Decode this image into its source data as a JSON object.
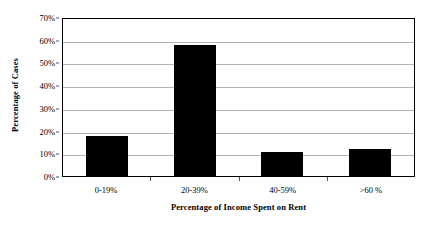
{
  "chart_data": {
    "type": "bar",
    "title": "",
    "subtitle": "",
    "xlabel": "Percentage of Income Spent on Rent",
    "ylabel": "Percentage of Cases",
    "categories": [
      "0-19%",
      "20-39%",
      "40-59%",
      ">60 %"
    ],
    "values": [
      17.5,
      57.5,
      10.5,
      12
    ],
    "series": [
      {
        "name": "Percentage of Cases",
        "values": [
          17.5,
          57.5,
          10.5,
          12
        ]
      }
    ],
    "ylim": [
      0,
      70
    ],
    "ytick_labels": [
      "0%",
      "10%",
      "20%",
      "30%",
      "40%",
      "50%",
      "60%",
      "70%"
    ],
    "ytick_values": [
      0,
      10,
      20,
      30,
      40,
      50,
      60,
      70
    ],
    "grid": "horizontal",
    "legend": "none",
    "bar_color": "#000000",
    "grid_color": "#b3b3b3",
    "axis_color": "#000000",
    "background_color": "#ffffff"
  }
}
